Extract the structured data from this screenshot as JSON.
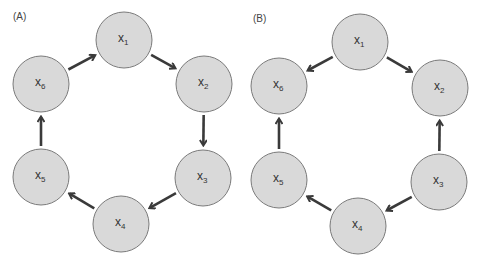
{
  "panels": [
    {
      "label": "(A)",
      "nodes": [
        {
          "id": "x1",
          "var": "x",
          "sub": "1"
        },
        {
          "id": "x2",
          "var": "x",
          "sub": "2"
        },
        {
          "id": "x3",
          "var": "x",
          "sub": "3"
        },
        {
          "id": "x4",
          "var": "x",
          "sub": "4"
        },
        {
          "id": "x5",
          "var": "x",
          "sub": "5"
        },
        {
          "id": "x6",
          "var": "x",
          "sub": "6"
        }
      ],
      "edges": [
        {
          "from": "x1",
          "to": "x2"
        },
        {
          "from": "x2",
          "to": "x3"
        },
        {
          "from": "x3",
          "to": "x4"
        },
        {
          "from": "x4",
          "to": "x5"
        },
        {
          "from": "x5",
          "to": "x6"
        },
        {
          "from": "x6",
          "to": "x1"
        }
      ]
    },
    {
      "label": "(B)",
      "nodes": [
        {
          "id": "x1",
          "var": "x",
          "sub": "1"
        },
        {
          "id": "x2",
          "var": "x",
          "sub": "2"
        },
        {
          "id": "x3",
          "var": "x",
          "sub": "3"
        },
        {
          "id": "x4",
          "var": "x",
          "sub": "4"
        },
        {
          "id": "x5",
          "var": "x",
          "sub": "5"
        },
        {
          "id": "x6",
          "var": "x",
          "sub": "6"
        }
      ],
      "edges": [
        {
          "from": "x1",
          "to": "x2"
        },
        {
          "from": "x1",
          "to": "x6"
        },
        {
          "from": "x3",
          "to": "x2"
        },
        {
          "from": "x3",
          "to": "x4"
        },
        {
          "from": "x4",
          "to": "x5"
        },
        {
          "from": "x5",
          "to": "x6"
        }
      ]
    }
  ],
  "colors": {
    "node_fill": "#d9d9d9",
    "node_stroke": "#7a7a7a",
    "edge": "#3a3a3a"
  }
}
